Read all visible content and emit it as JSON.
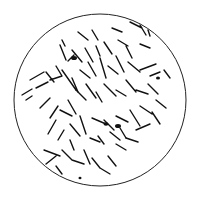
{
  "figure": {
    "background": "#ffffff",
    "ink": "#111111",
    "circle": {
      "cx": 100,
      "cy": 100,
      "r": 86
    }
  }
}
